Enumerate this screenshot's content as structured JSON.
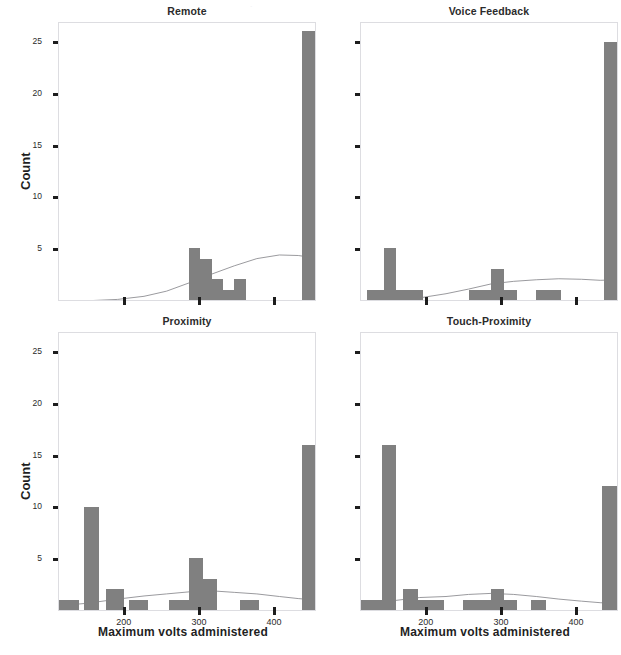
{
  "figure": {
    "width": 621,
    "height": 655,
    "background": "#ffffff",
    "bar_color": "#808080",
    "density_color": "#8e8e93",
    "axis_color": "#dddde1",
    "tick_color": "#1d1d1d",
    "top_artifact": "."
  },
  "axis": {
    "y_label": "Count",
    "x_label": "Maximum volts administered",
    "y_ticks": [
      5,
      10,
      15,
      20,
      25
    ],
    "x_ticks": [
      200,
      300,
      400
    ],
    "y_min": 0,
    "y_max": 27,
    "x_min": 112,
    "x_max": 455
  },
  "chart_data": {
    "type": "bar",
    "title": "",
    "subtitle": "",
    "xlabel": "Maximum volts administered",
    "ylabel": "Count",
    "xlim": [
      112,
      455
    ],
    "ylim": [
      0,
      27
    ],
    "grid": false,
    "legend": "none",
    "layout": "2x2 facet grid of histograms with kernel density overlay",
    "panels": [
      {
        "name": "Remote",
        "label": "Remote",
        "position": "top-left",
        "bins": [
          {
            "x_left": 285,
            "x_right": 300,
            "value": 5
          },
          {
            "x_left": 300,
            "x_right": 315,
            "value": 4
          },
          {
            "x_left": 315,
            "x_right": 330,
            "value": 2
          },
          {
            "x_left": 330,
            "x_right": 345,
            "value": 1
          },
          {
            "x_left": 345,
            "x_right": 360,
            "value": 2
          },
          {
            "x_left": 435,
            "x_right": 452,
            "value": 26
          }
        ],
        "density": [
          {
            "x": 112,
            "y": 0.05
          },
          {
            "x": 150,
            "y": 0.12
          },
          {
            "x": 190,
            "y": 0.25
          },
          {
            "x": 225,
            "y": 0.55
          },
          {
            "x": 255,
            "y": 1.05
          },
          {
            "x": 285,
            "y": 1.85
          },
          {
            "x": 315,
            "y": 2.7
          },
          {
            "x": 345,
            "y": 3.5
          },
          {
            "x": 375,
            "y": 4.2
          },
          {
            "x": 405,
            "y": 4.55
          },
          {
            "x": 430,
            "y": 4.5
          },
          {
            "x": 455,
            "y": 4.25
          }
        ]
      },
      {
        "name": "Voice Feedback",
        "label": "Voice Feedback",
        "position": "top-right",
        "bins": [
          {
            "x_left": 120,
            "x_right": 142,
            "value": 1
          },
          {
            "x_left": 142,
            "x_right": 158,
            "value": 5
          },
          {
            "x_left": 158,
            "x_right": 195,
            "value": 1
          },
          {
            "x_left": 255,
            "x_right": 285,
            "value": 1
          },
          {
            "x_left": 285,
            "x_right": 302,
            "value": 3
          },
          {
            "x_left": 302,
            "x_right": 320,
            "value": 1
          },
          {
            "x_left": 345,
            "x_right": 378,
            "value": 1
          },
          {
            "x_left": 435,
            "x_right": 452,
            "value": 25
          }
        ],
        "density": [
          {
            "x": 112,
            "y": 0.08
          },
          {
            "x": 150,
            "y": 0.2
          },
          {
            "x": 190,
            "y": 0.4
          },
          {
            "x": 225,
            "y": 0.8
          },
          {
            "x": 255,
            "y": 1.25
          },
          {
            "x": 285,
            "y": 1.75
          },
          {
            "x": 315,
            "y": 2.0
          },
          {
            "x": 345,
            "y": 2.15
          },
          {
            "x": 375,
            "y": 2.25
          },
          {
            "x": 405,
            "y": 2.2
          },
          {
            "x": 430,
            "y": 2.1
          },
          {
            "x": 455,
            "y": 2.15
          }
        ]
      },
      {
        "name": "Proximity",
        "label": "Proximity",
        "position": "bottom-left",
        "bins": [
          {
            "x_left": 112,
            "x_right": 138,
            "value": 1
          },
          {
            "x_left": 145,
            "x_right": 165,
            "value": 10
          },
          {
            "x_left": 175,
            "x_right": 198,
            "value": 2
          },
          {
            "x_left": 205,
            "x_right": 230,
            "value": 1
          },
          {
            "x_left": 258,
            "x_right": 285,
            "value": 1
          },
          {
            "x_left": 285,
            "x_right": 303,
            "value": 5
          },
          {
            "x_left": 303,
            "x_right": 322,
            "value": 3
          },
          {
            "x_left": 352,
            "x_right": 378,
            "value": 1
          },
          {
            "x_left": 435,
            "x_right": 455,
            "value": 16
          }
        ],
        "density": [
          {
            "x": 112,
            "y": 0.6
          },
          {
            "x": 150,
            "y": 0.85
          },
          {
            "x": 190,
            "y": 1.25
          },
          {
            "x": 225,
            "y": 1.55
          },
          {
            "x": 255,
            "y": 1.75
          },
          {
            "x": 285,
            "y": 1.95
          },
          {
            "x": 315,
            "y": 2.05
          },
          {
            "x": 345,
            "y": 1.9
          },
          {
            "x": 375,
            "y": 1.75
          },
          {
            "x": 405,
            "y": 1.5
          },
          {
            "x": 430,
            "y": 1.3
          },
          {
            "x": 455,
            "y": 1.15
          }
        ]
      },
      {
        "name": "Touch-Proximity",
        "label": "Touch-Proximity",
        "position": "bottom-right",
        "bins": [
          {
            "x_left": 112,
            "x_right": 140,
            "value": 1
          },
          {
            "x_left": 140,
            "x_right": 158,
            "value": 16
          },
          {
            "x_left": 168,
            "x_right": 188,
            "value": 2
          },
          {
            "x_left": 188,
            "x_right": 222,
            "value": 1
          },
          {
            "x_left": 248,
            "x_right": 285,
            "value": 1
          },
          {
            "x_left": 285,
            "x_right": 302,
            "value": 2
          },
          {
            "x_left": 302,
            "x_right": 320,
            "value": 1
          },
          {
            "x_left": 338,
            "x_right": 358,
            "value": 1
          },
          {
            "x_left": 432,
            "x_right": 455,
            "value": 12
          }
        ],
        "density": [
          {
            "x": 112,
            "y": 0.75
          },
          {
            "x": 150,
            "y": 1.05
          },
          {
            "x": 190,
            "y": 1.4
          },
          {
            "x": 225,
            "y": 1.5
          },
          {
            "x": 255,
            "y": 1.7
          },
          {
            "x": 285,
            "y": 1.8
          },
          {
            "x": 315,
            "y": 1.7
          },
          {
            "x": 345,
            "y": 1.5
          },
          {
            "x": 375,
            "y": 1.25
          },
          {
            "x": 405,
            "y": 1.05
          },
          {
            "x": 430,
            "y": 0.9
          },
          {
            "x": 455,
            "y": 0.8
          }
        ]
      }
    ]
  }
}
